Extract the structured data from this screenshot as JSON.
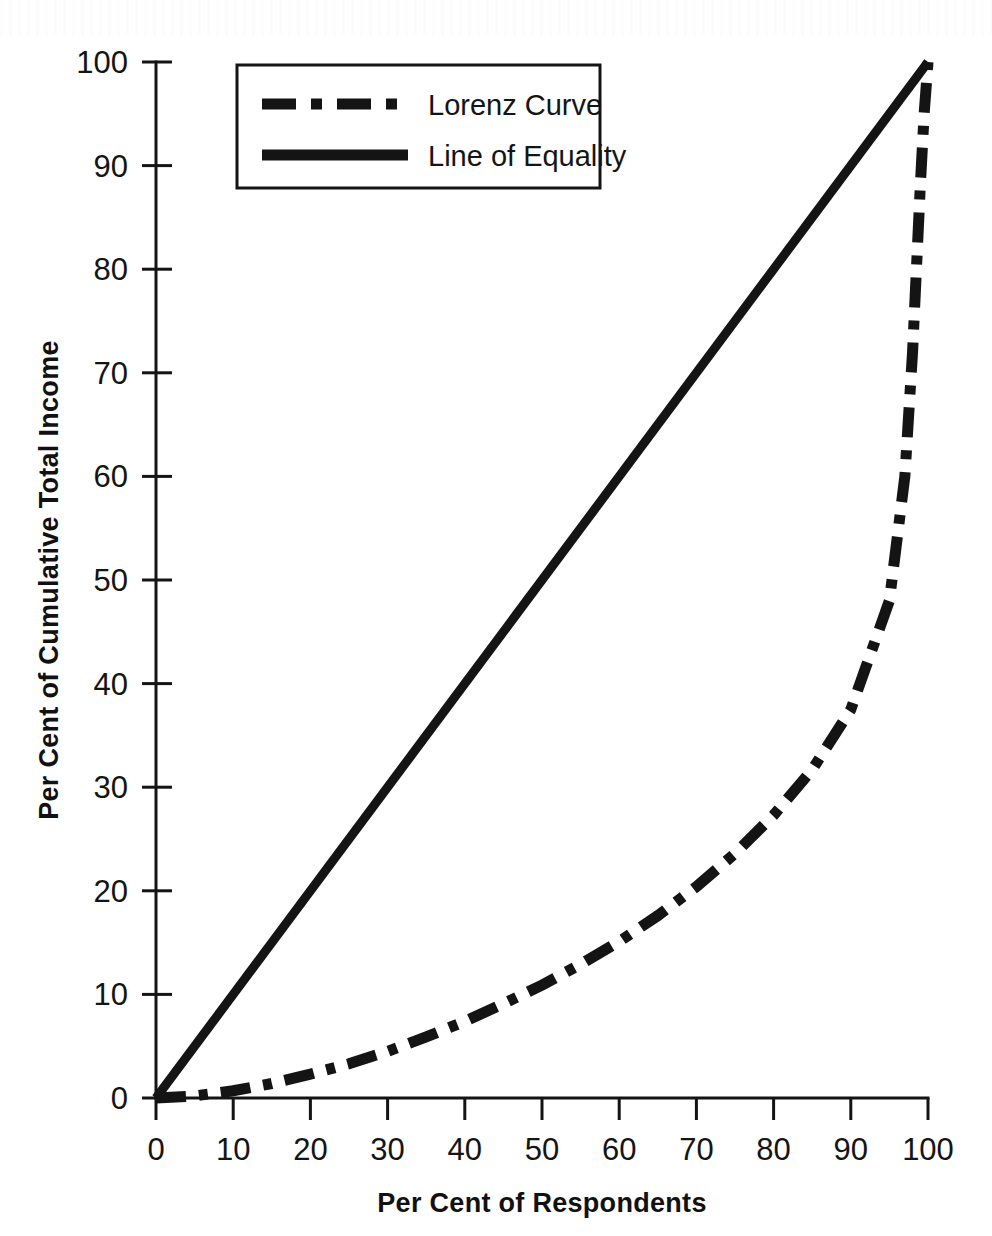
{
  "chart_data": {
    "type": "line",
    "title": "",
    "subtitle": "",
    "xlabel": "Per Cent of Respondents",
    "ylabel": "Per Cent of Cumulative Total Income",
    "xlim": [
      0,
      100
    ],
    "ylim": [
      0,
      100
    ],
    "xticks": [
      "0",
      "10",
      "20",
      "30",
      "40",
      "50",
      "60",
      "70",
      "80",
      "90",
      "100"
    ],
    "yticks": [
      "0",
      "10",
      "20",
      "30",
      "40",
      "50",
      "60",
      "70",
      "80",
      "90",
      "100"
    ],
    "grid": false,
    "legend_position": "top-left-inside",
    "series": [
      {
        "name": "Lorenz Curve",
        "style": "dash-dot",
        "color": "#141414",
        "x": [
          0,
          5,
          10,
          15,
          20,
          25,
          30,
          35,
          40,
          45,
          50,
          55,
          60,
          65,
          70,
          75,
          80,
          85,
          90,
          95,
          97,
          98,
          99,
          99.5,
          100
        ],
        "y": [
          0,
          0.2,
          0.7,
          1.4,
          2.3,
          3.3,
          4.5,
          5.9,
          7.4,
          9.1,
          10.9,
          12.9,
          15.1,
          17.6,
          20.4,
          23.6,
          27.3,
          31.7,
          37.5,
          48.0,
          60.0,
          72.0,
          88.0,
          95.0,
          100
        ]
      },
      {
        "name": "Line of Equality",
        "style": "solid",
        "color": "#141414",
        "x": [
          0,
          100
        ],
        "y": [
          0,
          100
        ]
      }
    ]
  },
  "legend": {
    "items": [
      {
        "label": "Lorenz Curve",
        "style": "dash-dot"
      },
      {
        "label": "Line of Equality",
        "style": "solid"
      }
    ]
  },
  "axes": {
    "x_title": "Per Cent of Respondents",
    "y_title": "Per Cent of Cumulative Total Income",
    "x_tick_labels": [
      "0",
      "10",
      "20",
      "30",
      "40",
      "50",
      "60",
      "70",
      "80",
      "90",
      "100"
    ],
    "y_tick_labels": [
      "0",
      "10",
      "20",
      "30",
      "40",
      "50",
      "60",
      "70",
      "80",
      "90",
      "100"
    ]
  },
  "colors": {
    "ink": "#141414",
    "background": "#ffffff"
  }
}
